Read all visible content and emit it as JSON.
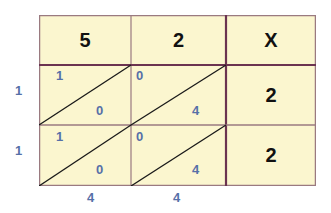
{
  "diagram": {
    "type": "lattice-multiplication",
    "operator": "X",
    "top_digits": [
      "5",
      "2"
    ],
    "right_digits": [
      "2",
      "2"
    ],
    "cells": [
      [
        {
          "tens": "1",
          "ones": "0"
        },
        {
          "tens": "0",
          "ones": "4"
        }
      ],
      [
        {
          "tens": "1",
          "ones": "0"
        },
        {
          "tens": "0",
          "ones": "4"
        }
      ]
    ],
    "left_result_digits": [
      "1",
      "1"
    ],
    "bottom_result_digits": [
      "4",
      "4"
    ],
    "colors": {
      "cell_fill": "#fbf6cf",
      "grid_line": "#6b3350",
      "thin_line": "#9a7a80",
      "diagonal": "#1a1a1a",
      "digit_blue": "#5670a8",
      "digit_black": "#111111"
    }
  }
}
